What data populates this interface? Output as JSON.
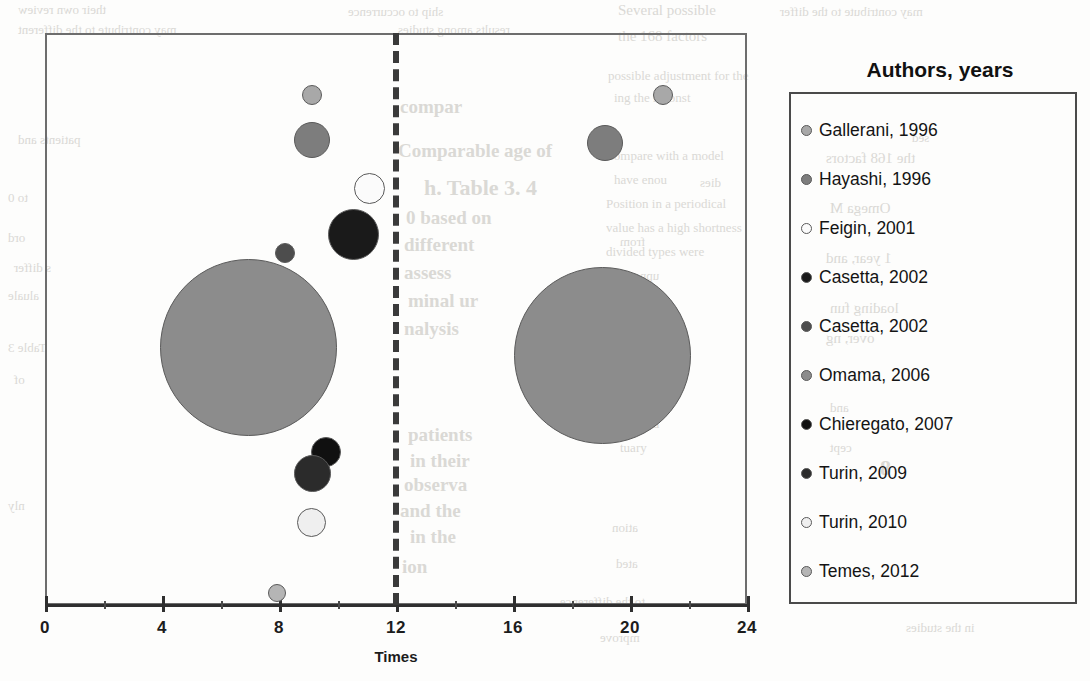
{
  "legend": {
    "title": "Authors, years",
    "items": [
      {
        "label": "Gallerani, 1996",
        "color": "#a8a8a8"
      },
      {
        "label": "Hayashi, 1996",
        "color": "#7d7d7d"
      },
      {
        "label": "Feigin, 2001",
        "color": "#fbfbfb"
      },
      {
        "label": "Casetta, 2002",
        "color": "#1a1a1a"
      },
      {
        "label": "Casetta, 2002",
        "color": "#4d4d4d"
      },
      {
        "label": "Omama, 2006",
        "color": "#8c8c8c"
      },
      {
        "label": "Chieregato, 2007",
        "color": "#101010"
      },
      {
        "label": "Turin, 2009",
        "color": "#2b2b2b"
      },
      {
        "label": "Turin, 2010",
        "color": "#efefef"
      },
      {
        "label": "Temes, 2012",
        "color": "#b5b5b5"
      }
    ]
  },
  "axis": {
    "title": "Times",
    "ticks": [
      0,
      4,
      8,
      12,
      16,
      20,
      24
    ],
    "minor_ticks": [
      2,
      6,
      10,
      14,
      18,
      22
    ]
  },
  "threshold": {
    "value": 12
  },
  "chart_data": {
    "type": "scatter",
    "title": "",
    "xlabel": "Times",
    "ylabel": "",
    "xlim": [
      0,
      24
    ],
    "grid": false,
    "legend_position": "right",
    "annotations": [
      "dashed vertical reference line at Times = 12"
    ],
    "series": [
      {
        "name": "Gallerani, 1996",
        "color": "#a8a8a8",
        "points": [
          {
            "x": 9.1,
            "size": 20,
            "px": 312,
            "py": 95,
            "r": 10
          },
          {
            "x": 21.1,
            "size": 20,
            "px": 663,
            "py": 95,
            "r": 10
          }
        ]
      },
      {
        "name": "Hayashi, 1996",
        "color": "#7d7d7d",
        "points": [
          {
            "x": 9.1,
            "size": 36,
            "px": 312,
            "py": 140,
            "r": 18
          },
          {
            "x": 19.1,
            "size": 36,
            "px": 605,
            "py": 143,
            "r": 18
          }
        ]
      },
      {
        "name": "Feigin, 2001",
        "color": "#fbfbfb",
        "points": [
          {
            "x": 11.0,
            "size": 31,
            "px": 369,
            "py": 188,
            "r": 15.5
          }
        ]
      },
      {
        "name": "Casetta, 2002",
        "color": "#1a1a1a",
        "points": [
          {
            "x": 10.5,
            "size": 51,
            "px": 353,
            "py": 234,
            "r": 25.5
          }
        ]
      },
      {
        "name": "Casetta, 2002",
        "color": "#4d4d4d",
        "points": [
          {
            "x": 8.2,
            "size": 20,
            "px": 285,
            "py": 253,
            "r": 10
          }
        ]
      },
      {
        "name": "Omama, 2006",
        "color": "#8c8c8c",
        "points": [
          {
            "x": 6.9,
            "size": 177,
            "px": 248,
            "py": 347,
            "r": 88.5
          },
          {
            "x": 19.0,
            "size": 177,
            "px": 602,
            "py": 355,
            "r": 88.5
          }
        ]
      },
      {
        "name": "Chieregato, 2007",
        "color": "#101010",
        "points": [
          {
            "x": 9.6,
            "size": 30,
            "px": 326,
            "py": 452,
            "r": 15
          }
        ]
      },
      {
        "name": "Turin, 2009",
        "color": "#2b2b2b",
        "points": [
          {
            "x": 9.1,
            "size": 37,
            "px": 312,
            "py": 473,
            "r": 18.5
          }
        ]
      },
      {
        "name": "Turin, 2010",
        "color": "#efefef",
        "points": [
          {
            "x": 9.1,
            "size": 29,
            "px": 311,
            "py": 522,
            "r": 14.5
          }
        ]
      },
      {
        "name": "Temes, 2012",
        "color": "#b5b5b5",
        "points": [
          {
            "x": 7.9,
            "size": 18,
            "px": 277,
            "py": 593,
            "r": 9
          }
        ]
      }
    ]
  },
  "ghost_text": [
    {
      "t": "their own review",
      "x": 18,
      "y": 2,
      "c": "flip s1"
    },
    {
      "t": "Several possible",
      "x": 618,
      "y": 2,
      "c": "s2"
    },
    {
      "t": "ship to occurrence",
      "x": 348,
      "y": 4,
      "c": "flip s1"
    },
    {
      "t": "may contribute to the differ",
      "x": 780,
      "y": 4,
      "c": "flip s1"
    },
    {
      "t": "may contribute to the different",
      "x": 18,
      "y": 22,
      "c": "flip s1"
    },
    {
      "t": "results among studies",
      "x": 398,
      "y": 22,
      "c": "flip s1"
    },
    {
      "t": "the 168 factors",
      "x": 618,
      "y": 28,
      "c": "s2"
    },
    {
      "t": "compar",
      "x": 400,
      "y": 96,
      "c": "s3"
    },
    {
      "t": "ing the reconst",
      "x": 614,
      "y": 90,
      "c": "s1"
    },
    {
      "t": "possible adjustment for the",
      "x": 608,
      "y": 68,
      "c": "s1"
    },
    {
      "t": "patients and",
      "x": 18,
      "y": 132,
      "c": "flip s1"
    },
    {
      "t": "Comparable age of",
      "x": 398,
      "y": 140,
      "c": "s3"
    },
    {
      "t": "h. Table 3. 4",
      "x": 424,
      "y": 175,
      "c": "s4"
    },
    {
      "t": "dies",
      "x": 700,
      "y": 175,
      "c": "flip s1"
    },
    {
      "t": "0 based on",
      "x": 406,
      "y": 207,
      "c": "s3"
    },
    {
      "t": "compare with a model",
      "x": 608,
      "y": 148,
      "c": "s1"
    },
    {
      "t": "have enou",
      "x": 614,
      "y": 172,
      "c": "s1"
    },
    {
      "t": "to 0",
      "x": 8,
      "y": 190,
      "c": "flip s1"
    },
    {
      "t": "different",
      "x": 404,
      "y": 234,
      "c": "s3"
    },
    {
      "t": "from",
      "x": 620,
      "y": 234,
      "c": "flip s1"
    },
    {
      "t": "ord",
      "x": 8,
      "y": 230,
      "c": "flip s1"
    },
    {
      "t": "Position in a periodical",
      "x": 606,
      "y": 196,
      "c": "s1"
    },
    {
      "t": "value has a high shortness",
      "x": 606,
      "y": 220,
      "c": "s1"
    },
    {
      "t": "divided types were",
      "x": 606,
      "y": 244,
      "c": "s1"
    },
    {
      "t": "s differ",
      "x": 14,
      "y": 260,
      "c": "flip s1"
    },
    {
      "t": "assess",
      "x": 404,
      "y": 262,
      "c": "s3"
    },
    {
      "t": "upper traum",
      "x": 596,
      "y": 268,
      "c": "flip s1"
    },
    {
      "t": "aluale",
      "x": 8,
      "y": 288,
      "c": "flip s1"
    },
    {
      "t": "minal ur",
      "x": 408,
      "y": 290,
      "c": "s3"
    },
    {
      "t": "medical",
      "x": 620,
      "y": 292,
      "c": "flip s1"
    },
    {
      "t": "nalysis",
      "x": 404,
      "y": 318,
      "c": "s3"
    },
    {
      "t": "correct",
      "x": 608,
      "y": 318,
      "c": "flip s1"
    },
    {
      "t": "ing",
      "x": 616,
      "y": 340,
      "c": "s1"
    },
    {
      "t": "Table 3",
      "x": 8,
      "y": 340,
      "c": "flip s1"
    },
    {
      "t": "the",
      "x": 620,
      "y": 372,
      "c": "flip s1"
    },
    {
      "t": "of",
      "x": 14,
      "y": 372,
      "c": "flip s1"
    },
    {
      "t": "patients",
      "x": 408,
      "y": 424,
      "c": "s3"
    },
    {
      "t": "reported",
      "x": 616,
      "y": 416,
      "c": "s1"
    },
    {
      "t": "in their",
      "x": 410,
      "y": 450,
      "c": "s3"
    },
    {
      "t": "tuary",
      "x": 620,
      "y": 440,
      "c": "s1"
    },
    {
      "t": "observa",
      "x": 404,
      "y": 474,
      "c": "s3"
    },
    {
      "t": "8",
      "x": 880,
      "y": 455,
      "c": "s4"
    },
    {
      "t": "and the",
      "x": 400,
      "y": 500,
      "c": "s3"
    },
    {
      "t": "nly",
      "x": 8,
      "y": 498,
      "c": "flip s1"
    },
    {
      "t": "in the",
      "x": 410,
      "y": 526,
      "c": "s3"
    },
    {
      "t": "ation",
      "x": 612,
      "y": 520,
      "c": "flip s1"
    },
    {
      "t": "ion",
      "x": 402,
      "y": 556,
      "c": "s3"
    },
    {
      "t": "ated",
      "x": 616,
      "y": 556,
      "c": "flip s1"
    },
    {
      "t": "to the difference",
      "x": 560,
      "y": 594,
      "c": "flip s1"
    },
    {
      "t": "mprove",
      "x": 600,
      "y": 630,
      "c": "flip s1"
    },
    {
      "t": "in the studies",
      "x": 906,
      "y": 620,
      "c": "flip s1"
    },
    {
      "t": "sed",
      "x": 912,
      "y": 130,
      "c": "flip s1"
    },
    {
      "t": "the 168 factors",
      "x": 826,
      "y": 150,
      "c": "flip s2"
    },
    {
      "t": "Omega M",
      "x": 830,
      "y": 200,
      "c": "flip s2"
    },
    {
      "t": "1 year, and",
      "x": 826,
      "y": 250,
      "c": "flip s2"
    },
    {
      "t": "loading fun",
      "x": 830,
      "y": 300,
      "c": "flip s2"
    },
    {
      "t": "over, ng",
      "x": 826,
      "y": 330,
      "c": "flip s2"
    },
    {
      "t": "and",
      "x": 830,
      "y": 400,
      "c": "flip s1"
    },
    {
      "t": "cept",
      "x": 830,
      "y": 440,
      "c": "flip s1"
    }
  ]
}
